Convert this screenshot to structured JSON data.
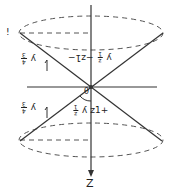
{
  "diagram": {
    "type": "double-cone",
    "colors": {
      "stroke": "#333333",
      "dashed": "#555555",
      "background": "#ffffff"
    },
    "axis_label": "Z",
    "angle_label": "θ",
    "top_left_mark": "!",
    "upper_left_label": {
      "prefix": "y",
      "num": "4",
      "den": "3"
    },
    "upper_center_label": {
      "prefix": "y",
      "num": "z",
      "den": "1",
      "suffix": "−z1−"
    },
    "lower_left_label": {
      "prefix": "y",
      "num": "4",
      "den": "3"
    },
    "lower_center_label": {
      "prefix": "y",
      "num": "z",
      "den": "1",
      "suffix": "z1+"
    }
  }
}
